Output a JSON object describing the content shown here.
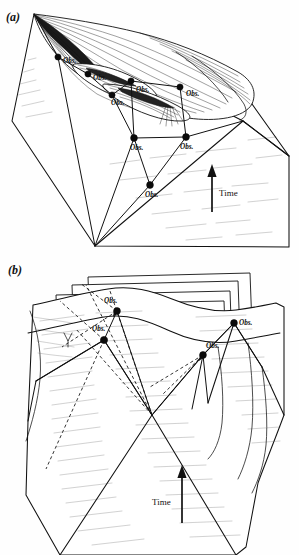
{
  "figure": {
    "background_color": "#ffffff",
    "ink_color": "#111111",
    "hatch_color": "#5a5a5a",
    "width": 299,
    "height": 555
  },
  "panels": [
    {
      "id": "a",
      "label": "(a)",
      "time_axis": {
        "label": "Time",
        "direction": "up",
        "label_side": "right"
      },
      "observers": [
        {
          "id": "a-obs-1",
          "label": "Obs.",
          "x": 58,
          "y": 57,
          "label_x": 63,
          "label_y": 63
        },
        {
          "id": "a-obs-2",
          "label": "Obs.",
          "x": 88,
          "y": 74,
          "label_x": 93,
          "label_y": 80
        },
        {
          "id": "a-obs-3",
          "label": "Obs.",
          "x": 131,
          "y": 81,
          "label_x": 136,
          "label_y": 92
        },
        {
          "id": "a-obs-4",
          "label": "Obs.",
          "x": 112,
          "y": 95,
          "label_x": 111,
          "label_y": 104
        },
        {
          "id": "a-obs-5",
          "label": "Obs.",
          "x": 180,
          "y": 87,
          "label_x": 186,
          "label_y": 96
        },
        {
          "id": "a-obs-6",
          "label": "Obs.",
          "x": 134,
          "y": 138,
          "label_x": 133,
          "label_y": 150
        },
        {
          "id": "a-obs-7",
          "label": "Obs.",
          "x": 186,
          "y": 137,
          "label_x": 182,
          "label_y": 149
        },
        {
          "id": "a-obs-8",
          "label": "Obs.",
          "x": 150,
          "y": 185,
          "label_x": 148,
          "label_y": 197
        }
      ]
    },
    {
      "id": "b",
      "label": "(b)",
      "time_axis": {
        "label": "Time",
        "direction": "up",
        "label_side": "left"
      },
      "observers": [
        {
          "id": "b-obs-1",
          "label": "Obs.",
          "x": 117,
          "y": 56,
          "label_x": 109,
          "label_y": 48
        },
        {
          "id": "b-obs-2",
          "label": "Obs.",
          "x": 104,
          "y": 85,
          "label_x": 97,
          "label_y": 76
        },
        {
          "id": "b-obs-3",
          "label": "Obs.",
          "x": 234,
          "y": 68,
          "label_x": 238,
          "label_y": 68
        },
        {
          "id": "b-obs-4",
          "label": "Obs.",
          "x": 203,
          "y": 100,
          "label_x": 205,
          "label_y": 92
        }
      ]
    }
  ],
  "legend": {
    "observer_marker": "filled-circle",
    "ray_style": "solid-line",
    "hidden_ray_style": "dashed-line"
  }
}
